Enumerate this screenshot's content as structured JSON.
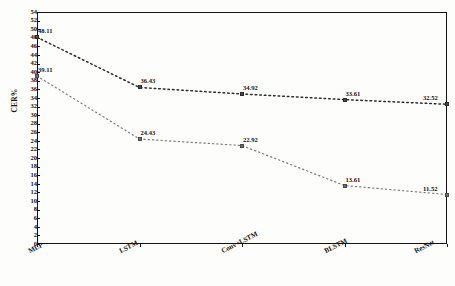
{
  "chart_data": {
    "type": "line",
    "title": "",
    "subtitle": "",
    "xlabel": "",
    "ylabel": "CER%",
    "categories": [
      "MLP",
      "LSTM",
      "Conv+LSTM",
      "BLSTM",
      "ResNet"
    ],
    "ylim": [
      0,
      54
    ],
    "ytick_step": 2,
    "yticks": [
      0,
      2,
      4,
      6,
      8,
      10,
      12,
      14,
      16,
      18,
      20,
      22,
      24,
      26,
      28,
      30,
      32,
      34,
      36,
      38,
      40,
      42,
      44,
      46,
      48,
      50,
      52,
      54
    ],
    "grid": false,
    "legend": "none",
    "series": [
      {
        "name": "upper",
        "style": "dotted",
        "color": "#2b2b2b",
        "marker": "square",
        "values": [
          48.11,
          36.43,
          34.92,
          33.61,
          32.52
        ],
        "labels": [
          "48.11",
          "36.43",
          "34.92",
          "33.61",
          "32.52"
        ]
      },
      {
        "name": "lower",
        "style": "dotted",
        "color": "#7a7a7a",
        "marker": "square",
        "values": [
          39.11,
          24.43,
          22.92,
          13.61,
          11.52
        ],
        "labels": [
          "39.11",
          "24.43",
          "22.92",
          "13.61",
          "11.52"
        ]
      }
    ]
  }
}
